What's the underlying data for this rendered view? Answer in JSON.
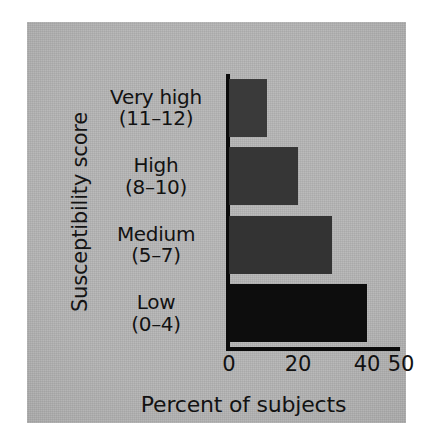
{
  "chart_data": {
    "type": "bar",
    "orientation": "horizontal",
    "title": "",
    "xlabel": "Percent of subjects",
    "ylabel": "Susceptibility score",
    "categories": [
      "Very high",
      "High",
      "Medium",
      "Low"
    ],
    "category_ranges": [
      "(11–12)",
      "(8–10)",
      "(5–7)",
      "(0–4)"
    ],
    "category_labels": [
      "Very high (11–12)",
      "High (8–10)",
      "Medium (5–7)",
      "Low (0–4)"
    ],
    "values": [
      11,
      20,
      30,
      40
    ],
    "xlim": [
      0,
      50
    ],
    "xticks": [
      0,
      20,
      40,
      50
    ],
    "xtick_labels": [
      "0",
      "20",
      "40",
      "50"
    ],
    "grid": false,
    "legend": false,
    "bar_colors": [
      "#3a3a3a",
      "#363636",
      "#333333",
      "#0d0d0d"
    ],
    "panel_background": "#b4b4b4",
    "axis_color": "#0b0b0b",
    "text_color": "#121212"
  }
}
